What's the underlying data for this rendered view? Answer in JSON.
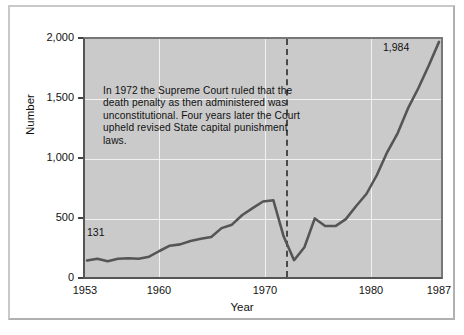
{
  "chart_data": {
    "type": "line",
    "title": "",
    "xlabel": "Year",
    "ylabel": "Number",
    "xlim": [
      1953,
      1987
    ],
    "ylim": [
      0,
      2000
    ],
    "grid": true,
    "legend": "none",
    "x_ticks": [
      "1953",
      "1960",
      "1970",
      "1980",
      "1987"
    ],
    "x_tick_values": [
      1953,
      1960,
      1970,
      1980,
      1987
    ],
    "y_ticks": [
      "0",
      "500",
      "1,000",
      "1,500",
      "2,000"
    ],
    "y_tick_values": [
      0,
      500,
      1000,
      1500,
      2000
    ],
    "x": [
      1953,
      1954,
      1955,
      1956,
      1957,
      1958,
      1959,
      1960,
      1961,
      1962,
      1963,
      1964,
      1965,
      1966,
      1967,
      1968,
      1969,
      1970,
      1971,
      1972,
      1973,
      1974,
      1975,
      1976,
      1977,
      1978,
      1979,
      1980,
      1981,
      1982,
      1983,
      1984,
      1985,
      1986,
      1987
    ],
    "values": [
      131,
      147,
      125,
      146,
      151,
      147,
      164,
      212,
      257,
      268,
      297,
      315,
      331,
      406,
      435,
      517,
      575,
      631,
      642,
      334,
      134,
      244,
      488,
      423,
      423,
      482,
      593,
      697,
      856,
      1050,
      1209,
      1420,
      1591,
      1781,
      1984
    ],
    "annotations": [
      {
        "name": "start-value",
        "label": "131",
        "x": 1953,
        "y": 131
      },
      {
        "name": "end-value",
        "label": "1,984",
        "x": 1987,
        "y": 1984
      },
      {
        "name": "supreme-court-note",
        "text": "In 1972 the Supreme Court ruled that the death penalty as then administered was unconstitutional. Four years later the Court upheld revised State capital punishment laws."
      },
      {
        "name": "vertical-marker-1972",
        "style": "dashed",
        "x": 1972
      }
    ],
    "colors": {
      "line": "#555555",
      "plot_background": "#cacaca",
      "gridlines": "#f2f2f2",
      "axis": "#555555",
      "marker_line": "#4a4a4a",
      "page_background": "#ffffff"
    }
  },
  "axes": {
    "y_label": "Number",
    "x_label": "Year",
    "y_ticks": [
      {
        "label": "2,000",
        "value": 2000
      },
      {
        "label": "1,500",
        "value": 1500
      },
      {
        "label": "1,000",
        "value": 1000
      },
      {
        "label": "500",
        "value": 500
      },
      {
        "label": "0",
        "value": 0
      }
    ],
    "x_ticks": [
      {
        "label": "1953",
        "value": 1953
      },
      {
        "label": "1960",
        "value": 1960
      },
      {
        "label": "1970",
        "value": 1970
      },
      {
        "label": "1980",
        "value": 1980
      },
      {
        "label": "1987",
        "value": 1987
      }
    ]
  },
  "annotation": {
    "text": "In 1972 the Supreme Court ruled that the death penalty as then administered was unconstitutional. Four years later the Court upheld revised State capital punishment laws."
  },
  "labels": {
    "start": "131",
    "end": "1,984"
  }
}
